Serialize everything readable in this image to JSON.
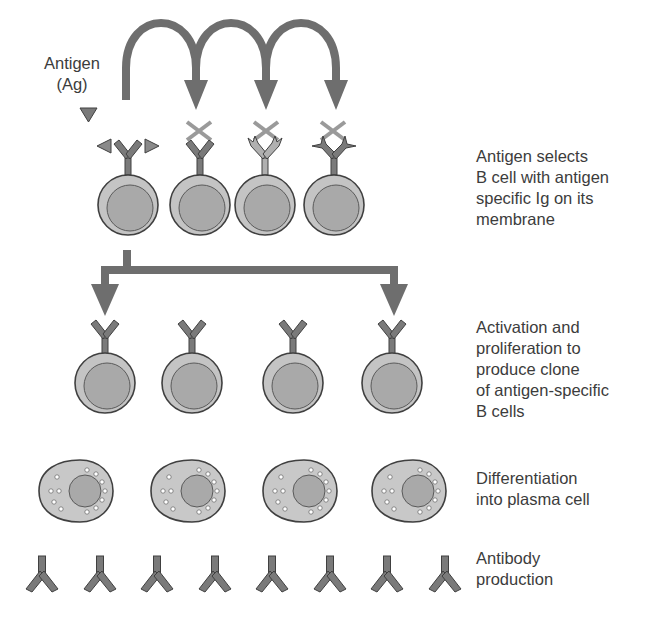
{
  "labels": {
    "antigen": "Antigen\n(Ag)",
    "step1": "Antigen selects\nB cell with antigen\nspecific Ig on its\nmembrane",
    "step2": "Activation and\nproliferation to\nproduce clone\nof antigen-specific\nB cells",
    "step3": "Differentiation\ninto plasma cell",
    "step4": "Antibody\nproduction"
  },
  "colors": {
    "arrow": "#6e6e6e",
    "cell_fill": "#c4c4c4",
    "nucleus_fill": "#a9a9a9",
    "outline": "#404040",
    "receptor": "#7a7a7a",
    "cross": "#9a9a9a",
    "plasma_fill": "#c8c8c8"
  },
  "rows": {
    "selection_cells": [
      {
        "x": 128,
        "receptor": "matching-with-antigen",
        "rejected": false
      },
      {
        "x": 200,
        "receptor": "standard",
        "rejected": true
      },
      {
        "x": 265,
        "receptor": "jagged",
        "rejected": true
      },
      {
        "x": 334,
        "receptor": "spiky",
        "rejected": true
      }
    ],
    "clone_cells": [
      {
        "x": 105
      },
      {
        "x": 190
      },
      {
        "x": 293
      },
      {
        "x": 393
      }
    ],
    "plasma_cells": [
      {
        "x": 78
      },
      {
        "x": 190
      },
      {
        "x": 300
      },
      {
        "x": 410
      }
    ],
    "antibodies": [
      {
        "x": 42
      },
      {
        "x": 100
      },
      {
        "x": 157
      },
      {
        "x": 215
      },
      {
        "x": 272
      },
      {
        "x": 330
      },
      {
        "x": 387
      },
      {
        "x": 445
      }
    ]
  }
}
